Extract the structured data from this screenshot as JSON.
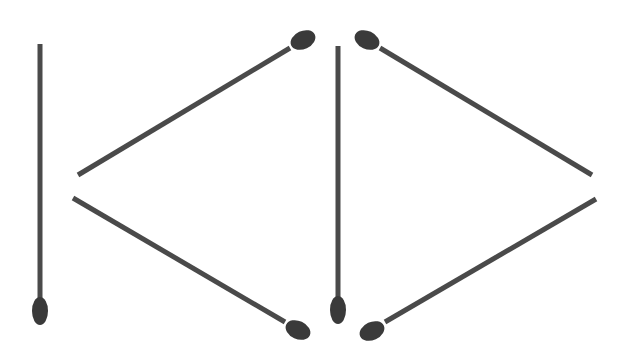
{
  "puzzle": {
    "description": "Six matchsticks arranged forming shapes resembling K and D / arrow shapes",
    "colors": {
      "stick": "#4a4a4a",
      "head": "#3a3a3a",
      "background": "#ffffff"
    },
    "matchsticks": [
      {
        "id": "m1",
        "x1": 40,
        "y1": 44,
        "x2": 40,
        "y2": 300,
        "head": "end",
        "hx": 40,
        "hy": 311,
        "rx": 8,
        "ry": 14,
        "rot": 0
      },
      {
        "id": "m2",
        "x1": 78,
        "y1": 175,
        "x2": 290,
        "y2": 48,
        "head": "end",
        "hx": 303,
        "hy": 40,
        "rx": 13,
        "ry": 9,
        "rot": -25
      },
      {
        "id": "m3",
        "x1": 73,
        "y1": 198,
        "x2": 285,
        "y2": 322,
        "head": "end",
        "hx": 298,
        "hy": 330,
        "rx": 13,
        "ry": 9,
        "rot": 25
      },
      {
        "id": "m4",
        "x1": 338,
        "y1": 46,
        "x2": 338,
        "y2": 300,
        "head": "end",
        "hx": 338,
        "hy": 310,
        "rx": 8,
        "ry": 14,
        "rot": 0
      },
      {
        "id": "m5",
        "x1": 380,
        "y1": 48,
        "x2": 592,
        "y2": 175,
        "head": "start",
        "hx": 367,
        "hy": 40,
        "rx": 13,
        "ry": 9,
        "rot": 25
      },
      {
        "id": "m6",
        "x1": 596,
        "y1": 199,
        "x2": 385,
        "y2": 322,
        "head": "end",
        "hx": 372,
        "hy": 331,
        "rx": 13,
        "ry": 9,
        "rot": -25
      }
    ]
  }
}
